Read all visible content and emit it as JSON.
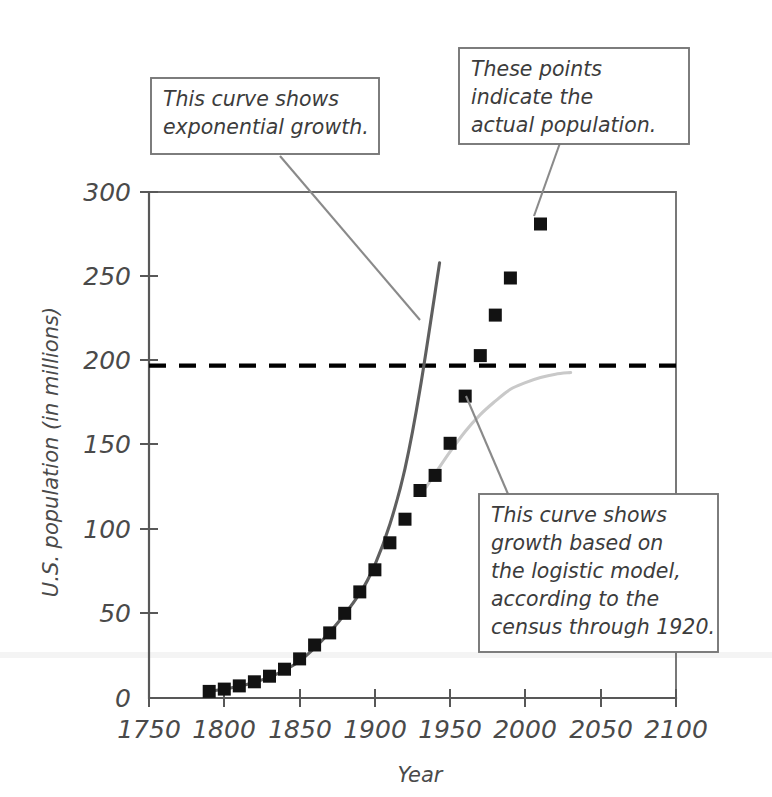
{
  "chart_data": {
    "type": "scatter",
    "title": "",
    "xlabel": "Year",
    "ylabel": "U.S. population (in millions)",
    "xlim": [
      1750,
      2100
    ],
    "ylim": [
      0,
      300
    ],
    "xticks": [
      1750,
      1800,
      1850,
      1900,
      1950,
      2000,
      2050,
      2100
    ],
    "xtick_labels": [
      "1750",
      "1800",
      "1850",
      "1900",
      "1950",
      "2000",
      "2050",
      "2100"
    ],
    "yticks": [
      0,
      50,
      100,
      150,
      200,
      250,
      300
    ],
    "ytick_labels": [
      "0",
      "50",
      "100",
      "150",
      "200",
      "250",
      "300"
    ],
    "grid": false,
    "legend": "none",
    "series": [
      {
        "name": "actual population",
        "type": "scatter",
        "marker": "filled-square",
        "color": "#121212",
        "x": [
          1790,
          1800,
          1810,
          1820,
          1830,
          1840,
          1850,
          1860,
          1870,
          1880,
          1890,
          1900,
          1910,
          1920,
          1930,
          1940,
          1950,
          1960,
          1970,
          1980,
          1990,
          2010
        ],
        "y": [
          3.9,
          5.3,
          7.2,
          9.6,
          12.9,
          17.1,
          23.2,
          31.4,
          38.6,
          50.2,
          62.9,
          76.0,
          92.0,
          106.0,
          123.0,
          132.0,
          151.0,
          179.0,
          203.0,
          227.0,
          249.0,
          281.0
        ]
      },
      {
        "name": "exponential model",
        "type": "line",
        "color": "#5f5f5f",
        "x": [
          1790,
          1810,
          1830,
          1850,
          1870,
          1890,
          1900,
          1910,
          1920,
          1930,
          1943
        ],
        "y": [
          3.9,
          7.0,
          12.4,
          22.0,
          39.0,
          62.0,
          79.0,
          103.0,
          136.0,
          183.0,
          258.0
        ]
      },
      {
        "name": "logistic model",
        "type": "line",
        "color": "#c9c9c9",
        "x": [
          1934,
          1940,
          1950,
          1960,
          1970,
          1980,
          1990,
          2000,
          2010,
          2020,
          2030
        ],
        "y": [
          125.0,
          133.0,
          146.0,
          158.0,
          168.0,
          176.0,
          183.0,
          187.0,
          190.0,
          192.0,
          193.0
        ]
      },
      {
        "name": "carrying capacity",
        "type": "line",
        "style": "dashed",
        "color": "#000000",
        "value": 197.0
      }
    ]
  },
  "annotations": [
    {
      "id": "exponential-note",
      "lines": [
        "This curve shows",
        "exponential growth."
      ]
    },
    {
      "id": "points-note",
      "lines": [
        "These points",
        "indicate the",
        "actual population."
      ]
    },
    {
      "id": "logistic-note",
      "lines": [
        "This curve shows",
        "growth based on",
        "the logistic model,",
        "according to the",
        "census through 1920."
      ]
    }
  ],
  "colors": {
    "exponential_curve": "#5f5f5f",
    "logistic_curve": "#c9c9c9",
    "asymptote": "#000000",
    "marker": "#121212",
    "axis": "#585858",
    "callout_border": "#777777",
    "text": "#3c3c3c"
  }
}
